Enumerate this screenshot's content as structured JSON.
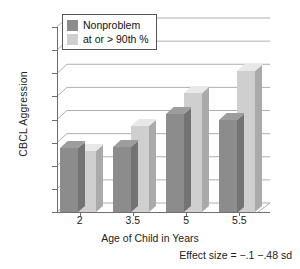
{
  "chart_data": {
    "type": "bar",
    "title": "",
    "xlabel": "Age of Child in Years",
    "ylabel": "CBCL Aggression",
    "categories": [
      "2",
      "3.5",
      "5",
      "5.5"
    ],
    "series": [
      {
        "name": "Nonproblem",
        "color": "#8c8c8c",
        "values": [
          57.5,
          57.6,
          60.5,
          60.0
        ]
      },
      {
        "name": "at or > 90th %",
        "color": "#cfcfcf",
        "values": [
          57.3,
          59.4,
          62.3,
          64.2
        ]
      }
    ],
    "ylim": [
      52,
      68
    ],
    "yticks": [
      52,
      54,
      56,
      58,
      60,
      62,
      64,
      66,
      68
    ],
    "grid": true,
    "legend_position": "top-left",
    "annotation": "Effect size = −.1 −.48 sd"
  },
  "legend": {
    "items": [
      {
        "label": "Nonproblem"
      },
      {
        "label": "at or > 90th %"
      }
    ]
  }
}
